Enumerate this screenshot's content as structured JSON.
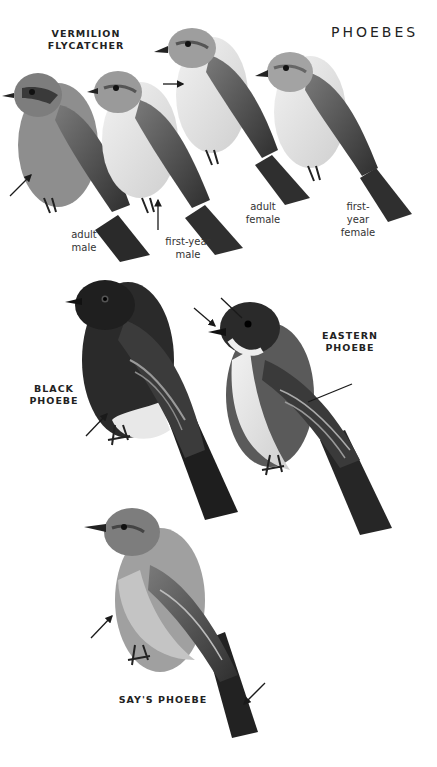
{
  "plate": {
    "title": "PHOEBES",
    "colors": {
      "background": "#ffffff",
      "text": "#222222",
      "ink": "#1a1a1a"
    }
  },
  "species": [
    {
      "name": "VERMILION\nFLYCATCHER",
      "plumages": [
        {
          "caption": "adult\nmale"
        },
        {
          "caption": "first-year\nmale"
        },
        {
          "caption": "adult\nfemale"
        },
        {
          "caption": "first-\nyear\nfemale"
        }
      ]
    },
    {
      "name": "BLACK\nPHOEBE"
    },
    {
      "name": "EASTERN\nPHOEBE"
    },
    {
      "name": "SAY'S PHOEBE"
    }
  ]
}
